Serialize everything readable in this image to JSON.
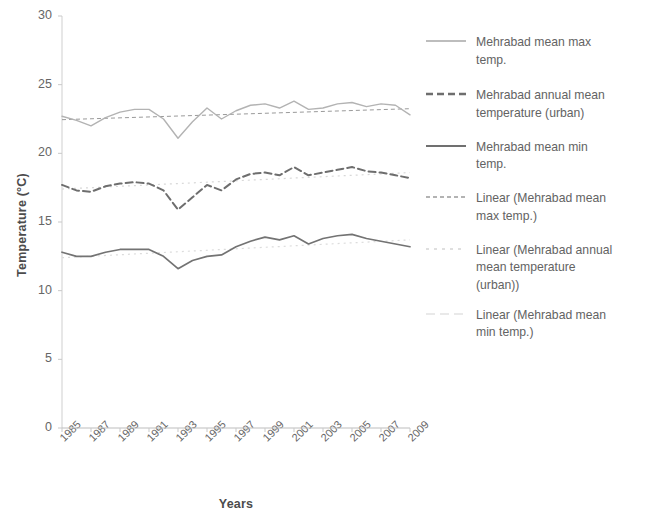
{
  "chart_data": {
    "type": "line",
    "title": "",
    "xlabel": "Years",
    "ylabel": "Temperature (°C)",
    "xlim": [
      1985,
      2009
    ],
    "ylim": [
      0,
      30
    ],
    "ytick_labels": [
      "30",
      "25",
      "20",
      "15",
      "10",
      "5",
      "0"
    ],
    "ytick_values": [
      30,
      25,
      20,
      15,
      10,
      5,
      0
    ],
    "xtick_labels": [
      "1985",
      "1987",
      "1989",
      "1991",
      "1993",
      "1995",
      "1997",
      "1999",
      "2001",
      "2003",
      "2005",
      "2007",
      "2009"
    ],
    "xtick_values": [
      1985,
      1987,
      1989,
      1991,
      1993,
      1995,
      1997,
      1999,
      2001,
      2003,
      2005,
      2007,
      2009
    ],
    "grid": false,
    "legend_position": "right",
    "x": [
      1985,
      1986,
      1987,
      1988,
      1989,
      1990,
      1991,
      1992,
      1993,
      1994,
      1995,
      1996,
      1997,
      1998,
      1999,
      2000,
      2001,
      2002,
      2003,
      2004,
      2005,
      2006,
      2007,
      2008,
      2009
    ],
    "series": [
      {
        "name": "Mehrabad mean max temp.",
        "style": "solid-light",
        "color": "#b3b3b3",
        "values": [
          22.7,
          22.4,
          22.0,
          22.6,
          23.0,
          23.2,
          23.2,
          22.5,
          21.1,
          22.3,
          23.3,
          22.5,
          23.1,
          23.5,
          23.6,
          23.3,
          23.8,
          23.2,
          23.3,
          23.6,
          23.7,
          23.4,
          23.6,
          23.5,
          22.8
        ]
      },
      {
        "name": "Mehrabad annual mean temperature (urban)",
        "style": "dashed",
        "color": "#6e6e6e",
        "values": [
          17.7,
          17.3,
          17.2,
          17.6,
          17.8,
          17.9,
          17.8,
          17.3,
          15.9,
          16.8,
          17.7,
          17.3,
          18.1,
          18.5,
          18.6,
          18.4,
          19.0,
          18.4,
          18.6,
          18.8,
          19.0,
          18.7,
          18.6,
          18.4,
          18.2
        ]
      },
      {
        "name": "Mehrabad mean min temp.",
        "style": "solid",
        "color": "#737373",
        "values": [
          12.8,
          12.5,
          12.5,
          12.8,
          13.0,
          13.0,
          13.0,
          12.5,
          11.6,
          12.2,
          12.5,
          12.6,
          13.2,
          13.6,
          13.9,
          13.7,
          14.0,
          13.4,
          13.8,
          14.0,
          14.1,
          13.8,
          13.6,
          13.4,
          13.2
        ]
      }
    ],
    "trendlines": [
      {
        "name": "Linear (Mehrabad mean max temp.)",
        "style": "fine-dashed",
        "color": "#9a9a9a",
        "start": 22.45,
        "end": 23.25
      },
      {
        "name": "Linear (Mehrabad annual mean temperature (urban))",
        "style": "dotted-faint",
        "color": "#d8d8d8",
        "start": 17.4,
        "end": 18.6
      },
      {
        "name": "Linear (Mehrabad mean min temp.)",
        "style": "dotted-faint",
        "color": "#dcdcdc",
        "start": 12.4,
        "end": 13.7
      }
    ]
  },
  "legend": {
    "items": [
      {
        "label": "Mehrabad mean max\ntemp.",
        "marker": "line-light-solid",
        "color": "#b8b8b8"
      },
      {
        "label": "Mehrabad annual mean\ntemperature (urban)",
        "marker": "line-dashed",
        "color": "#6e6e6e"
      },
      {
        "label": "Mehrabad mean min\ntemp.",
        "marker": "line-solid",
        "color": "#707070"
      },
      {
        "label": "Linear (Mehrabad mean\nmax temp.)",
        "marker": "line-fine-dashed",
        "color": "#9a9a9a"
      },
      {
        "label": "Linear (Mehrabad annual\nmean temperature\n(urban))",
        "marker": "line-dotted-faint",
        "color": "#dadada"
      },
      {
        "label": "Linear (Mehrabad mean\nmin temp.)",
        "marker": "line-dotted-faintest",
        "color": "#e0e0e0"
      }
    ]
  },
  "axes": {
    "y_title": "Temperature (°C)",
    "x_title": "Years"
  }
}
